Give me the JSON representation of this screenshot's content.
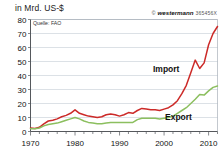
{
  "chart_data": {
    "type": "line",
    "title": "in Mrd. US-$",
    "ylabel": "in Mrd. US-$",
    "xlabel": "",
    "source": "Quelle: FAO",
    "grid": true,
    "legend_position": "inline-annotation",
    "xlim": [
      1970,
      2012
    ],
    "ylim": [
      0,
      80
    ],
    "yticks": [
      0,
      10,
      20,
      30,
      40,
      50,
      60,
      70,
      80
    ],
    "xticks": [
      1970,
      1980,
      1990,
      2000,
      2010
    ],
    "xtick_minor_step": 2,
    "x": [
      1970,
      1971,
      1972,
      1973,
      1974,
      1975,
      1976,
      1977,
      1978,
      1979,
      1980,
      1981,
      1982,
      1983,
      1984,
      1985,
      1986,
      1987,
      1988,
      1989,
      1990,
      1991,
      1992,
      1993,
      1994,
      1995,
      1996,
      1997,
      1998,
      1999,
      2000,
      2001,
      2002,
      2003,
      2004,
      2005,
      2006,
      2007,
      2008,
      2009,
      2010,
      2011,
      2012
    ],
    "series": [
      {
        "name": "Import",
        "color": "#cc2a28",
        "label": "Import",
        "values": [
          2.5,
          2.2,
          3.0,
          5.5,
          7.5,
          8.0,
          9.0,
          10.5,
          11.5,
          13.0,
          15.5,
          13.0,
          12.0,
          11.0,
          10.5,
          10.0,
          10.5,
          12.0,
          12.5,
          12.0,
          11.0,
          12.0,
          13.5,
          13.0,
          15.0,
          16.5,
          16.0,
          15.5,
          15.5,
          15.0,
          16.0,
          17.0,
          19.0,
          22.0,
          27.0,
          33.0,
          42.0,
          51.0,
          45.0,
          49.0,
          62.0,
          70.0,
          75.0
        ]
      },
      {
        "name": "Export",
        "color": "#8cbf5f",
        "label": "Export",
        "values": [
          2.0,
          2.0,
          2.5,
          4.0,
          5.0,
          5.5,
          6.0,
          7.0,
          8.0,
          9.0,
          10.0,
          9.0,
          7.5,
          6.5,
          6.0,
          5.5,
          5.5,
          6.0,
          6.5,
          6.5,
          6.5,
          6.5,
          6.5,
          6.5,
          8.5,
          9.5,
          9.5,
          9.5,
          9.5,
          9.0,
          9.5,
          10.0,
          11.0,
          13.0,
          15.0,
          17.0,
          20.0,
          23.0,
          26.5,
          26.0,
          29.0,
          31.5,
          32.5
        ]
      }
    ]
  },
  "credit": {
    "mark": "©",
    "brand": "westermann",
    "code": "365456X"
  }
}
